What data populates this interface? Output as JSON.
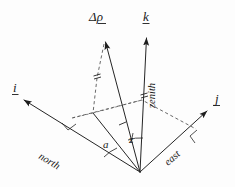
{
  "figure": {
    "background_color": "#fdfdfd",
    "ink_color": "#252525"
  },
  "axes": [
    {
      "id": "i",
      "label": "i",
      "label_style": "underlined-vector",
      "axis_name": "north",
      "direction": "upper-left",
      "tip": [
        18,
        97
      ],
      "origin": [
        140,
        172
      ]
    },
    {
      "id": "j",
      "label": "j",
      "label_style": "underlined-vector",
      "axis_name": "east",
      "direction": "upper-right",
      "tip": [
        212,
        108
      ],
      "origin": [
        140,
        172
      ]
    },
    {
      "id": "k",
      "label": "k",
      "label_style": "underlined-vector",
      "axis_name": "zenith",
      "direction": "up",
      "tip": [
        146,
        32
      ],
      "origin": [
        140,
        172
      ]
    }
  ],
  "vectors": [
    {
      "id": "delta-rho",
      "label": "Δρ",
      "label_style": "underlined-vector",
      "tip": [
        104,
        37
      ],
      "origin": [
        140,
        172
      ],
      "tick_marks": 1
    }
  ],
  "angles": [
    {
      "id": "azimuth",
      "label": "a",
      "description": "azimuth angle measured from north",
      "vertex": [
        140,
        172
      ]
    },
    {
      "id": "zenith-angle",
      "label": "z",
      "description": "zenith angle between vector and zenith",
      "vertex": [
        140,
        172
      ]
    }
  ],
  "axis_names": {
    "north": "north",
    "east": "east",
    "zenith": "zenith"
  },
  "ground_plane": {
    "style": "dashed",
    "description": "horizontal plane projection with right-angle marks"
  },
  "projection": {
    "foot_point": [
      93,
      113
    ],
    "style": "dashed",
    "description": "vertical drop from Δρ tip to horizontal plane"
  }
}
